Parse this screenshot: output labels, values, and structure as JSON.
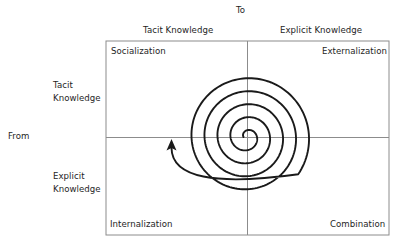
{
  "diagram": {
    "axis_top": "To",
    "axis_left": "From",
    "columns": [
      {
        "label": "Tacit Knowledge"
      },
      {
        "label": "Explicit Knowledge"
      }
    ],
    "rows": [
      {
        "label_line1": "Tacit",
        "label_line2": "Knowledge"
      },
      {
        "label_line1": "Explicit",
        "label_line2": "Knowledge"
      }
    ],
    "quadrants": {
      "top_left": "Socialization",
      "top_right": "Externalization",
      "bottom_left": "Internalization",
      "bottom_right": "Combination"
    },
    "spiral": {
      "description": "knowledge spiral expanding outward from the center, ending in an arrow pointing up into Socialization",
      "turns": 5,
      "stroke_color": "#1a1a1a",
      "frame_color": "#8c8c8c"
    }
  }
}
